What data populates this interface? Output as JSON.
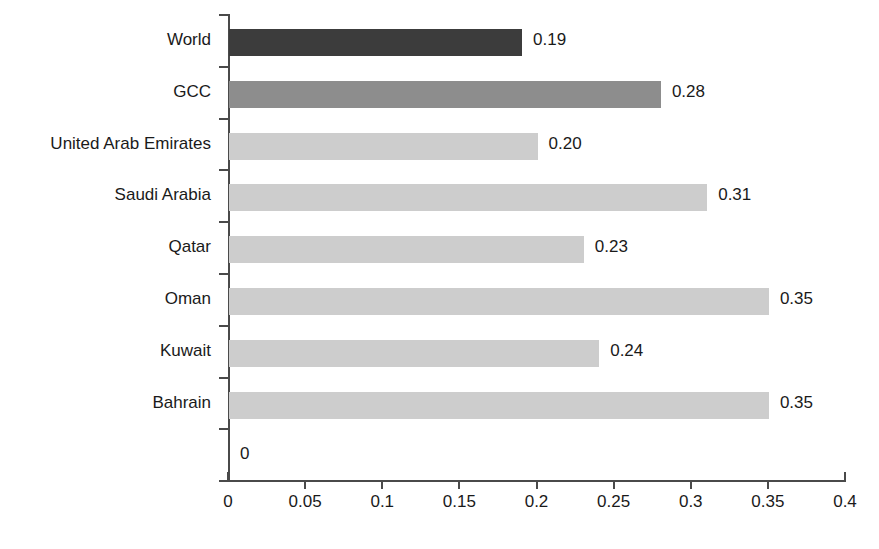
{
  "chart_data": {
    "type": "bar",
    "orientation": "horizontal",
    "title": "",
    "subtitle": "",
    "xlabel": "",
    "ylabel": "",
    "xlim": [
      0,
      0.4
    ],
    "xticks": [
      "0",
      "0.05",
      "0.1",
      "0.15",
      "0.2",
      "0.25",
      "0.3",
      "0.35",
      "0.4"
    ],
    "xtick_values": [
      0,
      0.05,
      0.1,
      0.15,
      0.2,
      0.25,
      0.3,
      0.35,
      0.4
    ],
    "grid": false,
    "legend": "none",
    "categories": [
      "World",
      "GCC",
      "United Arab Emirates",
      "Saudi Arabia",
      "Qatar",
      "Oman",
      "Kuwait",
      "Bahrain",
      ""
    ],
    "values": [
      0.19,
      0.28,
      0.2,
      0.31,
      0.23,
      0.35,
      0.24,
      0.35,
      0
    ],
    "labels": [
      "0.19",
      "0.28",
      "0.20",
      "0.31",
      "0.23",
      "0.35",
      "0.24",
      "0.35",
      "0"
    ],
    "bar_colors": [
      "#3c3c3c",
      "#8d8d8d",
      "#cdcdcd",
      "#cdcdcd",
      "#cdcdcd",
      "#cdcdcd",
      "#cdcdcd",
      "#cdcdcd",
      "#cdcdcd"
    ],
    "series": [
      {
        "name": "",
        "values": [
          0.19,
          0.28,
          0.2,
          0.31,
          0.23,
          0.35,
          0.24,
          0.35,
          0
        ]
      }
    ],
    "colors": {
      "world": "#3c3c3c",
      "gcc": "#8d8d8d",
      "country": "#cdcdcd",
      "axis": "#4a4a4a",
      "text": "#1a1a1a",
      "background": "#ffffff"
    }
  }
}
